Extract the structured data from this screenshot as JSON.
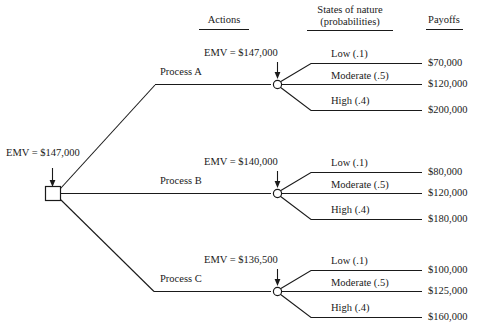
{
  "diagram": {
    "title_row": {
      "actions_header": "Actions",
      "states_header_line1": "States of nature",
      "states_header_line2": "(probabilities)",
      "payoffs_header": "Payoffs"
    },
    "root": {
      "emv_label": "EMV = $147,000",
      "node_type": "decision-square"
    },
    "branches": [
      {
        "action_label": "Process A",
        "emv_label": "EMV = $147,000",
        "node_type": "chance-circle",
        "outcomes": [
          {
            "state_label": "Low (.1)",
            "payoff": "$70,000"
          },
          {
            "state_label": "Moderate (.5)",
            "payoff": "$120,000"
          },
          {
            "state_label": "High (.4)",
            "payoff": "$200,000"
          }
        ]
      },
      {
        "action_label": "Process B",
        "emv_label": "EMV = $140,000",
        "node_type": "chance-circle",
        "outcomes": [
          {
            "state_label": "Low (.1)",
            "payoff": "$80,000"
          },
          {
            "state_label": "Moderate (.5)",
            "payoff": "$120,000"
          },
          {
            "state_label": "High (.4)",
            "payoff": "$180,000"
          }
        ]
      },
      {
        "action_label": "Process C",
        "emv_label": "EMV = $136,500",
        "node_type": "chance-circle",
        "outcomes": [
          {
            "state_label": "Low (.1)",
            "payoff": "$100,000"
          },
          {
            "state_label": "Moderate (.5)",
            "payoff": "$125,000"
          },
          {
            "state_label": "High (.4)",
            "payoff": "$160,000"
          }
        ]
      }
    ],
    "colors": {
      "ink": "#1a1a1a",
      "background": "#ffffff"
    }
  }
}
